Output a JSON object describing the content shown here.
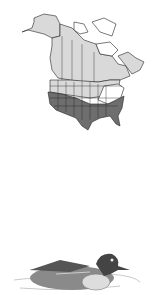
{
  "range_map": {
    "region": "North America",
    "legend": {
      "breeding_color": "#d9d9d9",
      "year_round_color": "#a8a8a8",
      "wintering_color": "#6e6e6e",
      "no_range_color": "#ffffff",
      "border_color": "#222222"
    }
  },
  "illustration": {
    "subject": "duck",
    "style": "grayscale engraving"
  }
}
